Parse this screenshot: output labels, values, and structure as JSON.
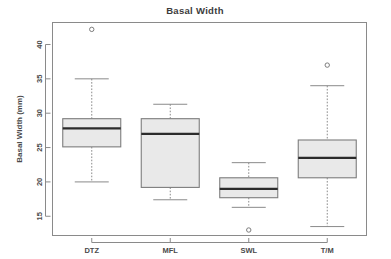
{
  "chart_data": {
    "type": "box",
    "title": "Basal Width",
    "xlabel": "",
    "ylabel": "Basal Width (mm)",
    "categories": [
      "DTZ",
      "MFL",
      "SWL",
      "T/M"
    ],
    "ylim": [
      12.2,
      43.2
    ],
    "yticks": [
      15,
      20,
      25,
      30,
      35,
      40
    ],
    "ytick_labels": [
      "15",
      "20",
      "25",
      "30",
      "35",
      "40"
    ],
    "grid": false,
    "legend": "none",
    "boxes": [
      {
        "category": "DTZ",
        "whisker_low": 20.0,
        "q1": 25.1,
        "median": 27.8,
        "q3": 29.2,
        "whisker_high": 35.0,
        "outliers": [
          42.2
        ]
      },
      {
        "category": "MFL",
        "whisker_low": 17.4,
        "q1": 19.2,
        "median": 27.0,
        "q3": 29.2,
        "whisker_high": 31.3,
        "outliers": []
      },
      {
        "category": "SWL",
        "whisker_low": 16.3,
        "q1": 17.7,
        "median": 19.0,
        "q3": 20.6,
        "whisker_high": 22.8,
        "outliers": [
          13.0
        ]
      },
      {
        "category": "T/M",
        "whisker_low": 13.5,
        "q1": 20.6,
        "median": 23.5,
        "q3": 26.1,
        "whisker_high": 34.0,
        "outliers": [
          37.0
        ]
      }
    ],
    "colors": {
      "box_fill": "#e9e9e9",
      "box_border": "#7d7d7d",
      "median": "#2b2b2b",
      "axis": "#8a8a8a",
      "text": "#4a4a4a",
      "background": "#ffffff"
    }
  }
}
